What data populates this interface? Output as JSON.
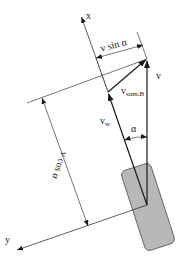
{
  "diagram": {
    "colors": {
      "line": "#1a1a1a",
      "wheel_fill": "#b8b8b8",
      "wheel_stroke": "#555555",
      "background": "#ffffff"
    },
    "axes": {
      "x_label": "x",
      "y_label": "y"
    },
    "vectors": {
      "v": {
        "label": "v"
      },
      "v_w": {
        "label": "v",
        "subscript": "w"
      },
      "v_sum_B": {
        "label": "v",
        "subscript": "sum,B"
      }
    },
    "angle": {
      "label": "α"
    },
    "dimensions": {
      "v_sin_alpha": "v sin α",
      "v_cos_alpha": "v cos α"
    },
    "elements": [
      "x-axis",
      "y-axis",
      "wheel",
      "v-vector",
      "vw-vector",
      "vsumB-vector",
      "alpha-arc",
      "v-sin-alpha-dimension",
      "v-cos-alpha-dimension"
    ]
  }
}
